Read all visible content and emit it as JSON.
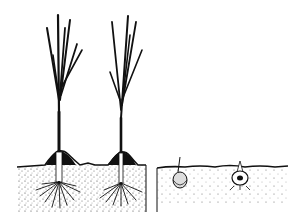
{
  "illustration": {
    "description": "Line drawing: two leek/onion seedlings earthed up in soil cross-section (left) and two bulbs planted in soil (right)",
    "colors": {
      "ink": "#111111",
      "background": "#ffffff"
    },
    "panels": [
      {
        "name": "earthed-up-seedlings",
        "plants": 2
      },
      {
        "name": "planted-bulbs",
        "bulbs": 2
      }
    ]
  }
}
